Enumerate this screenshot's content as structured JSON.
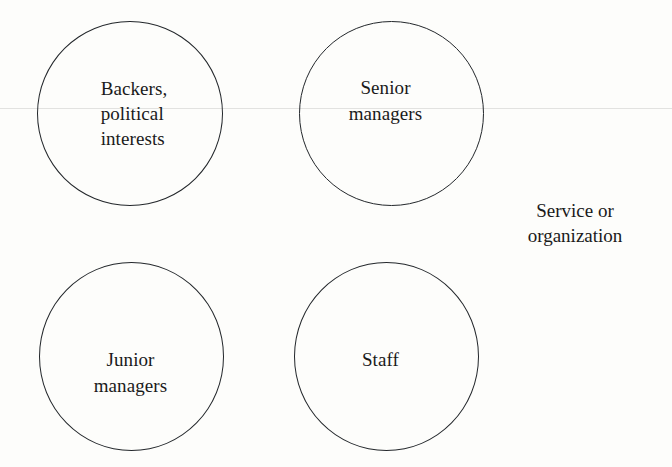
{
  "figure": {
    "background_color": "#fdfdfb",
    "stroke_color": "#23272b",
    "text_color": "#1a1a1a",
    "rule_color": "#e2e2e0"
  },
  "nodes": [
    {
      "id": "backers",
      "label": "Backers,\npolitical\ninterests",
      "align": "left"
    },
    {
      "id": "senior",
      "label": "Senior\nmanagers",
      "align": "center"
    },
    {
      "id": "junior",
      "label": "Junior\nmanagers",
      "align": "center"
    },
    {
      "id": "staff",
      "label": "Staff",
      "align": "center"
    }
  ],
  "annotations": {
    "system_label": "Service or\norganization"
  }
}
